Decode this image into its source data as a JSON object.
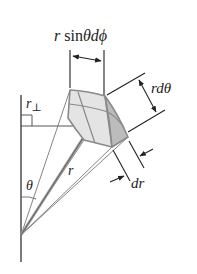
{
  "diagram": {
    "type": "spherical-volume-element",
    "labels": {
      "arc_phi": {
        "r": "r",
        "sin": " sin",
        "theta": "θ",
        "d": "d",
        "phi": "ϕ"
      },
      "arc_theta": "rdθ",
      "radial": "dr",
      "radius": "r",
      "polar_angle": "θ",
      "perp_r": "r",
      "perp_symbol": "⊥"
    },
    "colors": {
      "line": "#333333",
      "light_line": "#666666",
      "face_light": "#e6e6e6",
      "face_mid": "#d0d0d0",
      "face_dark": "#b4b4b4",
      "edge": "#8a8a8a",
      "background": "#ffffff"
    }
  }
}
